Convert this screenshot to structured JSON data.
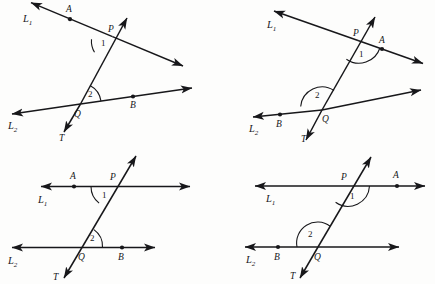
{
  "figure": {
    "type": "geometry-diagram-set",
    "background_color": "#fdfdfc",
    "ink_color": "#17171a",
    "panel_count": 4,
    "panels": [
      {
        "id": "top-left",
        "position": "top-left",
        "arrangement": "oblique-non-parallel",
        "line1_label": "L",
        "line1_subscript": "1",
        "line2_label": "L",
        "line2_subscript": "2",
        "transversal_label": "T",
        "point_p": "P",
        "point_q": "Q",
        "point_a": "A",
        "point_b": "B",
        "angle1_label": "1",
        "angle2_label": "2",
        "angle1_type": "acute",
        "angle1_opens": "left-below-L1",
        "angle2_type": "acute",
        "angle2_opens": "right-above-L2",
        "point_a_side": "left-of-P",
        "point_b_side": "right-of-Q"
      },
      {
        "id": "top-right",
        "position": "top-right",
        "arrangement": "oblique-non-parallel",
        "line1_label": "L",
        "line1_subscript": "1",
        "line2_label": "L",
        "line2_subscript": "2",
        "transversal_label": "T",
        "point_p": "P",
        "point_q": "Q",
        "point_a": "A",
        "point_b": "B",
        "angle1_label": "1",
        "angle2_label": "2",
        "angle1_type": "obtuse",
        "angle1_opens": "right-below-L1",
        "angle2_type": "obtuse",
        "angle2_opens": "left-above-L2",
        "point_a_side": "right-of-P",
        "point_b_side": "left-of-Q"
      },
      {
        "id": "bottom-left",
        "position": "bottom-left",
        "arrangement": "parallel-horizontal",
        "line1_label": "L",
        "line1_subscript": "1",
        "line2_label": "L",
        "line2_subscript": "2",
        "transversal_label": "T",
        "point_p": "P",
        "point_q": "Q",
        "point_a": "A",
        "point_b": "B",
        "angle1_label": "1",
        "angle2_label": "2",
        "angle1_type": "acute",
        "angle1_opens": "left-below-L1",
        "angle2_type": "acute",
        "angle2_opens": "right-above-L2",
        "point_a_side": "left-of-P",
        "point_b_side": "right-of-Q"
      },
      {
        "id": "bottom-right",
        "position": "bottom-right",
        "arrangement": "parallel-horizontal",
        "line1_label": "L",
        "line1_subscript": "1",
        "line2_label": "L",
        "line2_subscript": "2",
        "transversal_label": "T",
        "point_p": "P",
        "point_q": "Q",
        "point_a": "A",
        "point_b": "B",
        "angle1_label": "1",
        "angle2_label": "2",
        "angle1_type": "obtuse",
        "angle1_opens": "right-below-L1",
        "angle2_type": "obtuse",
        "angle2_opens": "left-above-L2",
        "point_a_side": "right-of-P",
        "point_b_side": "left-of-Q"
      }
    ]
  }
}
